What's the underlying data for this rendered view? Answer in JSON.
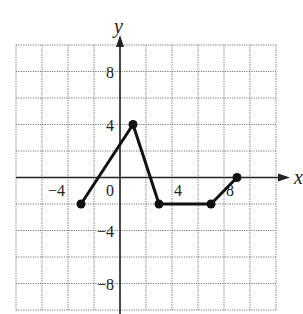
{
  "chart_data": {
    "type": "line",
    "title": "",
    "xlabel": "x",
    "ylabel": "y",
    "xlim": [
      -8,
      12
    ],
    "ylim": [
      -10,
      10
    ],
    "grid": true,
    "grid_step": 2,
    "x_tick_labels": [
      {
        "value": -4,
        "label": "−4"
      },
      {
        "value": 0,
        "label": "0"
      },
      {
        "value": 4,
        "label": "4"
      },
      {
        "value": 8,
        "label": "8"
      }
    ],
    "y_tick_labels": [
      {
        "value": 8,
        "label": "8"
      },
      {
        "value": 4,
        "label": "4"
      },
      {
        "value": -4,
        "label": "−4"
      },
      {
        "value": -8,
        "label": "−8"
      }
    ],
    "series": [
      {
        "name": "piecewise",
        "points": [
          [
            -3,
            -2
          ],
          [
            1,
            4
          ],
          [
            3,
            -2
          ],
          [
            7,
            -2
          ],
          [
            9,
            0
          ]
        ],
        "x": [
          -3,
          1,
          3,
          7,
          9
        ],
        "values": [
          -2,
          4,
          -2,
          -2,
          0
        ],
        "markers": "filled-circle"
      }
    ],
    "legend": "none"
  }
}
